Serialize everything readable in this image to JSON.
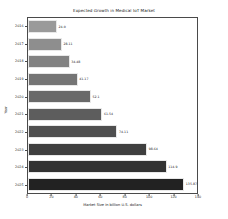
{
  "chart_data": {
    "type": "bar",
    "orientation": "horizontal",
    "title": "Expected Growth in Medical IoT Market",
    "xlabel": "Market Size in billion U.S. dollars",
    "ylabel": "Year",
    "categories": [
      "2016",
      "2017",
      "2018",
      "2019",
      "2020",
      "2021",
      "2022",
      "2023",
      "2024",
      "2025"
    ],
    "values": [
      24.0,
      28.11,
      34.48,
      41.17,
      52.1,
      61.54,
      74.11,
      98.64,
      114.9,
      135.87
    ],
    "value_labels": [
      "24.0",
      "28.11",
      "34.48",
      "41.17",
      "52.1",
      "61.54",
      "74.11",
      "98.64",
      "114.9",
      "135.87"
    ],
    "bar_colors": [
      "#9a9a9a",
      "#8e8e8e",
      "#828282",
      "#757575",
      "#696969",
      "#5d5d5d",
      "#4f4f4f",
      "#3f3f3f",
      "#333333",
      "#222222"
    ],
    "xlim": [
      0,
      140
    ],
    "xticks": [
      0,
      20,
      40,
      60,
      80,
      100,
      120,
      140
    ],
    "xtick_labels": [
      "0",
      "20",
      "40",
      "60",
      "80",
      "100",
      "120",
      "140"
    ],
    "grid": false,
    "legend": "none"
  }
}
